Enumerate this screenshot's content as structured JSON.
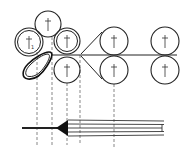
{
  "diagram": {
    "type": "calender roll schematic",
    "labels": {
      "roll_left_sub": "1"
    },
    "rolls": [
      {
        "id": "top",
        "cx": 48,
        "cy": 24,
        "r": 13,
        "double": false
      },
      {
        "id": "left",
        "cx": 29,
        "cy": 42,
        "r": 14,
        "double": true
      },
      {
        "id": "right-upper",
        "cx": 67,
        "cy": 41,
        "r": 13,
        "double": true
      },
      {
        "id": "right-lower",
        "cx": 67,
        "cy": 70,
        "r": 13,
        "double": false
      },
      {
        "id": "mid-upper",
        "cx": 114,
        "cy": 41,
        "r": 14,
        "double": false
      },
      {
        "id": "mid-lower",
        "cx": 114,
        "cy": 70,
        "r": 14,
        "double": false
      },
      {
        "id": "end-upper",
        "cx": 165,
        "cy": 41,
        "r": 14,
        "double": false
      },
      {
        "id": "end-lower",
        "cx": 165,
        "cy": 70,
        "r": 14,
        "double": false
      }
    ],
    "dashed_lines_x": [
      37,
      52,
      67,
      80,
      114
    ],
    "colors": {
      "stroke": "#222222",
      "background": "#ffffff"
    }
  }
}
